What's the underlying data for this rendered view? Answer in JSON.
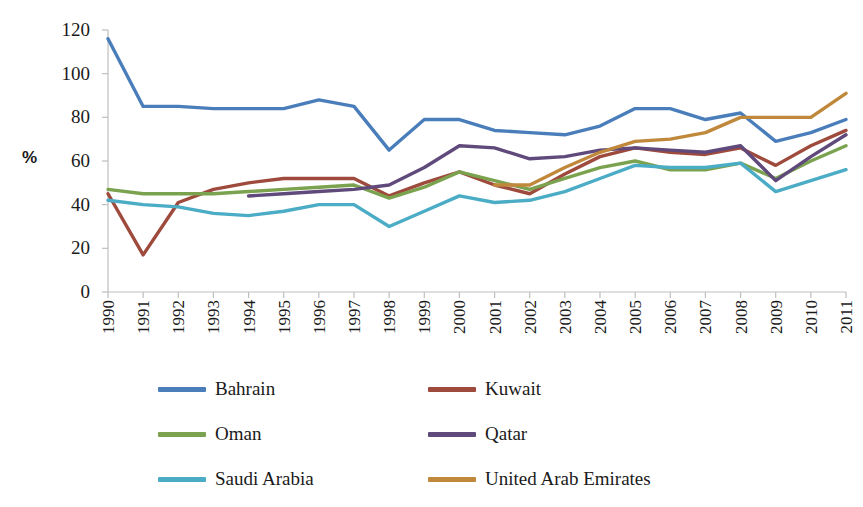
{
  "chart_data": {
    "type": "line",
    "title": "",
    "xlabel": "",
    "ylabel": "%",
    "ylim": [
      0,
      120
    ],
    "ytick_values": [
      0,
      20,
      40,
      60,
      80,
      100,
      120
    ],
    "grid": false,
    "legend_position": "bottom",
    "x": [
      "1990",
      "1991",
      "1992",
      "1993",
      "1994",
      "1995",
      "1996",
      "1997",
      "1998",
      "1999",
      "2000",
      "2001",
      "2002",
      "2003",
      "2004",
      "2005",
      "2006",
      "2007",
      "2008",
      "2009",
      "2010",
      "2011"
    ],
    "series": [
      {
        "name": "Bahrain",
        "color": "#4A7EBB",
        "values": [
          116,
          85,
          85,
          84,
          84,
          84,
          88,
          85,
          65,
          79,
          79,
          74,
          73,
          72,
          76,
          84,
          84,
          79,
          82,
          69,
          73,
          79
        ]
      },
      {
        "name": "Kuwait",
        "color": "#9E4A3C",
        "values": [
          45,
          17,
          41,
          47,
          50,
          52,
          52,
          52,
          44,
          50,
          55,
          49,
          45,
          54,
          62,
          66,
          64,
          63,
          66,
          58,
          67,
          74
        ]
      },
      {
        "name": "Oman",
        "color": "#7BA34F",
        "values": [
          47,
          45,
          45,
          45,
          46,
          47,
          48,
          49,
          43,
          48,
          55,
          51,
          47,
          52,
          57,
          60,
          56,
          56,
          59,
          52,
          60,
          67
        ]
      },
      {
        "name": "Qatar",
        "color": "#604A7B",
        "values": [
          null,
          null,
          null,
          null,
          44,
          45,
          46,
          47,
          49,
          57,
          67,
          66,
          61,
          62,
          65,
          66,
          65,
          64,
          67,
          51,
          62,
          72
        ]
      },
      {
        "name": "Saudi Arabia",
        "color": "#4BACC6",
        "values": [
          42,
          40,
          39,
          36,
          35,
          37,
          40,
          40,
          30,
          37,
          44,
          41,
          42,
          46,
          52,
          58,
          57,
          57,
          59,
          46,
          51,
          56
        ]
      },
      {
        "name": "United Arab Emirates",
        "color": "#C0883B",
        "values": [
          null,
          null,
          null,
          null,
          null,
          null,
          null,
          null,
          null,
          null,
          null,
          49,
          49,
          57,
          64,
          69,
          70,
          73,
          80,
          80,
          80,
          91
        ]
      }
    ]
  },
  "legend": {
    "items": [
      {
        "label": "Bahrain",
        "color": "#4A7EBB",
        "row": 0,
        "col": 0
      },
      {
        "label": "Kuwait",
        "color": "#9E4A3C",
        "row": 0,
        "col": 1
      },
      {
        "label": "Oman",
        "color": "#7BA34F",
        "row": 1,
        "col": 0
      },
      {
        "label": "Qatar",
        "color": "#604A7B",
        "row": 1,
        "col": 1
      },
      {
        "label": "Saudi Arabia",
        "color": "#4BACC6",
        "row": 2,
        "col": 0
      },
      {
        "label": "United Arab Emirates",
        "color": "#C0883B",
        "row": 2,
        "col": 1
      }
    ]
  },
  "axis": {
    "y_title": "%",
    "axis_line_color": "#BFBFBF"
  }
}
